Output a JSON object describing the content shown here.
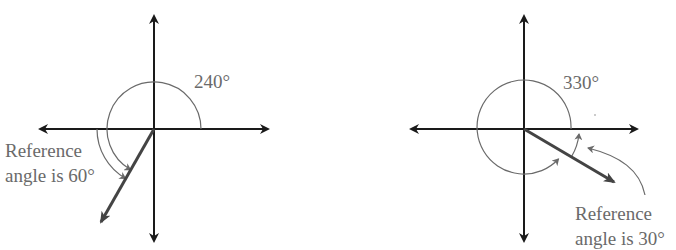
{
  "figures": [
    {
      "id": "left",
      "angle_label": "240°",
      "angle_deg": 240,
      "reference_label_line1": "Reference",
      "reference_label_line2": "angle is 60°",
      "reference_angle_deg": 60
    },
    {
      "id": "right",
      "angle_label": "330°",
      "angle_deg": 330,
      "reference_label_line1": "Reference",
      "reference_label_line2": "angle is 30°",
      "reference_angle_deg": 30
    }
  ],
  "colors": {
    "axis": "#1a1a1a",
    "ray": "#444444",
    "arc": "#6a6a6a",
    "text": "#6a6a6a"
  }
}
